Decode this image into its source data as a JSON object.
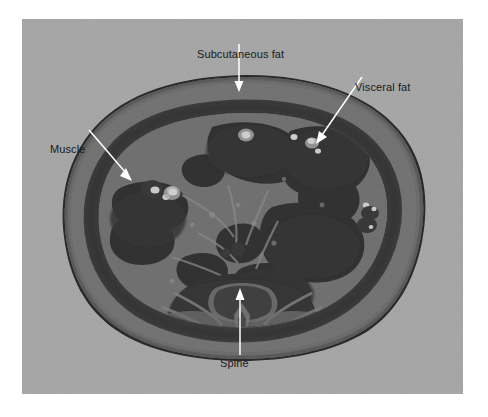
{
  "figure": {
    "kind": "ct-scan-axial-abdomen",
    "background_color": "#ffffff",
    "scan_background_color": "#a9a9a9",
    "label_text_color": "#1a1a1a",
    "leader_line_color": "#ffffff"
  },
  "annotations": [
    {
      "id": "subcutaneous-fat",
      "label": "Subcutaneous fat",
      "pointer": "down-arrow"
    },
    {
      "id": "visceral-fat",
      "label": "Visceral fat",
      "pointer": "diagonal-arrow-down-left"
    },
    {
      "id": "muscle",
      "label": "Muscle",
      "pointer": "diagonal-arrow-down-right"
    },
    {
      "id": "spine",
      "label": "Spine",
      "pointer": "up-arrow"
    }
  ]
}
